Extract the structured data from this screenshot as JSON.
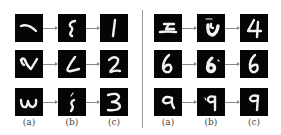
{
  "figure": {
    "columns": [
      "(a)",
      "(b)",
      "(c)"
    ],
    "panels": [
      {
        "name": "left",
        "rows": [
          {
            "a": "stroke resembling '1' (tilted)",
            "b": "noisy 'S'-like stroke",
            "c": "1"
          },
          {
            "a": "distorted '2'",
            "b": "noisy 'L'-like 2",
            "c": "2"
          },
          {
            "a": "rotated '3' (ω-like)",
            "b": "noisy fragmented stroke",
            "c": "3"
          }
        ]
      },
      {
        "name": "right",
        "rows": [
          {
            "a": "distorted '4'",
            "b": "noisy 'U'-like blob",
            "c": "4"
          },
          {
            "a": "6",
            "b": "noisy blob 6",
            "c": "6"
          },
          {
            "a": "9",
            "b": "noisy 9",
            "c": "9"
          }
        ]
      }
    ],
    "colors": {
      "tile_bg": "#050505",
      "stroke": "#f2f2f2",
      "arrow": "#8a8a8a",
      "separator": "#9a9a9a"
    }
  }
}
